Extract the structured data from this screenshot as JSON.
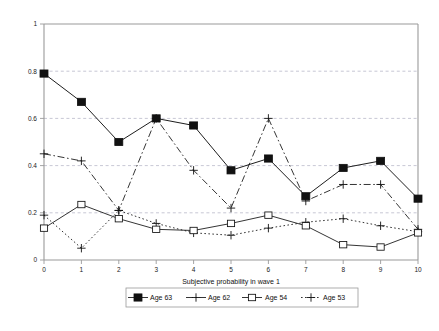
{
  "chart_data": {
    "type": "line",
    "title": "",
    "xlabel": "Subjective probability in wave 1",
    "ylabel": "",
    "x": [
      0,
      1,
      2,
      3,
      4,
      5,
      6,
      7,
      8,
      9,
      10
    ],
    "xtick_labels": [
      "0",
      "1",
      "2",
      "3",
      "4",
      "5",
      "6",
      "7",
      "8",
      "9",
      "10"
    ],
    "ytick_labels": [
      "0",
      "0.2",
      "0.4",
      "0.6",
      "0.8",
      "1"
    ],
    "ytick_values": [
      0,
      0.2,
      0.4,
      0.6,
      0.8,
      1
    ],
    "xlim": [
      0,
      10
    ],
    "ylim": [
      0,
      1
    ],
    "grid": "horizontal-dashed",
    "legend_position": "below-axes",
    "series": [
      {
        "name": "Age 63",
        "marker": "filled-square",
        "line_style": "solid",
        "values": [
          0.79,
          0.67,
          0.5,
          0.6,
          0.57,
          0.38,
          0.43,
          0.27,
          0.39,
          0.42,
          0.26
        ]
      },
      {
        "name": "Age 62",
        "marker": "plus",
        "line_style": "dash-dot",
        "values": [
          0.45,
          0.42,
          0.21,
          0.6,
          0.38,
          0.22,
          0.6,
          0.25,
          0.32,
          0.32,
          0.13
        ]
      },
      {
        "name": "Age 54",
        "marker": "open-square",
        "line_style": "solid",
        "values": [
          0.135,
          0.235,
          0.175,
          0.13,
          0.125,
          0.155,
          0.19,
          0.145,
          0.065,
          0.055,
          0.115
        ]
      },
      {
        "name": "Age 53",
        "marker": "plus",
        "line_style": "dotted",
        "values": [
          0.19,
          0.05,
          0.21,
          0.155,
          0.115,
          0.105,
          0.135,
          0.16,
          0.175,
          0.145,
          0.12
        ]
      }
    ]
  },
  "legend": {
    "entries": [
      {
        "label": "Age 63"
      },
      {
        "label": "Age 62"
      },
      {
        "label": "Age 54"
      },
      {
        "label": "Age 53"
      }
    ]
  },
  "caption": {
    "text": ""
  },
  "colors": {
    "ink": "#111111",
    "axis": "#9a9a9a",
    "grid": "#b9b9c9",
    "marker_fill": "#111111",
    "background": "#ffffff"
  }
}
